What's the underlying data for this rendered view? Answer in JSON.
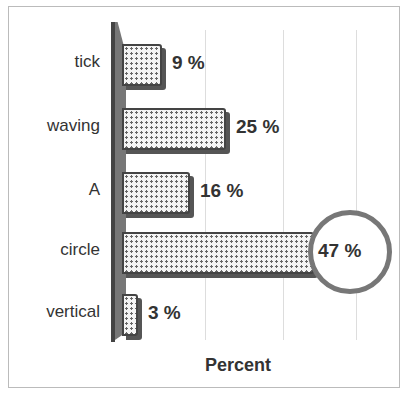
{
  "chart_data": {
    "type": "bar",
    "orientation": "horizontal",
    "categories": [
      "tick",
      "waving",
      "A",
      "circle",
      "vertical"
    ],
    "values": [
      9,
      25,
      16,
      47,
      3
    ],
    "labels": [
      "9 %",
      "25 %",
      "16 %",
      "47 %",
      "3 %"
    ],
    "title": "",
    "xlabel": "Percent",
    "ylabel": "",
    "xlim": [
      0,
      55
    ],
    "grid": true,
    "legend": "none",
    "annotations": [
      "circle around 47 % label"
    ]
  }
}
